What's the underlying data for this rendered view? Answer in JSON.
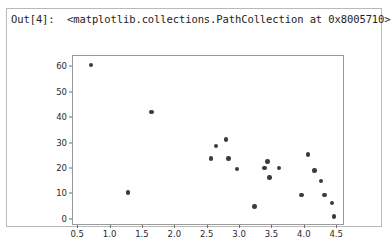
{
  "output_cell": {
    "prompt_label": "Out[4]:",
    "repr_text": "<matplotlib.collections.PathCollection at 0x8005710>",
    "header_line": "Out[4]:  <matplotlib.collections.PathCollection at 0x8005710>",
    "border_color": "#b9b9b9",
    "background_color": "#ffffff"
  },
  "chart_data": {
    "type": "scatter",
    "title": "",
    "xlabel": "",
    "ylabel": "",
    "xlim": [
      0.42,
      4.62
    ],
    "ylim": [
      -2.5,
      64.5
    ],
    "xticks": [
      0.5,
      1.0,
      1.5,
      2.0,
      2.5,
      3.0,
      3.5,
      4.0,
      4.5
    ],
    "xtick_labels": [
      "0.5",
      "1.0",
      "1.5",
      "2.0",
      "2.5",
      "3.0",
      "3.5",
      "4.0",
      "4.5"
    ],
    "yticks": [
      0,
      10,
      20,
      30,
      40,
      50,
      60
    ],
    "ytick_labels": [
      "0",
      "10",
      "20",
      "30",
      "40",
      "50",
      "60"
    ],
    "grid": false,
    "legend": null,
    "marker_color": "#3b3b3b",
    "marker_size": 4.6,
    "series": [
      {
        "name": "PathCollection",
        "points": [
          [
            0.7,
            61.0
          ],
          [
            1.27,
            10.7
          ],
          [
            1.63,
            42.5
          ],
          [
            2.55,
            24.0
          ],
          [
            2.63,
            29.0
          ],
          [
            2.78,
            31.7
          ],
          [
            2.82,
            24.0
          ],
          [
            2.95,
            20.0
          ],
          [
            3.22,
            5.2
          ],
          [
            3.38,
            20.3
          ],
          [
            3.42,
            23.0
          ],
          [
            3.45,
            16.6
          ],
          [
            3.6,
            20.3
          ],
          [
            3.95,
            9.7
          ],
          [
            4.05,
            25.6
          ],
          [
            4.15,
            19.4
          ],
          [
            4.25,
            15.3
          ],
          [
            4.3,
            9.7
          ],
          [
            4.42,
            6.5
          ],
          [
            4.45,
            1.2
          ]
        ]
      }
    ]
  }
}
